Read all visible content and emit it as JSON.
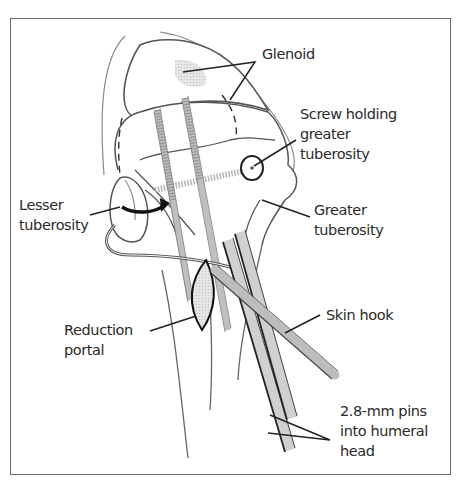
{
  "figure": {
    "type": "surgical-illustration"
  },
  "labels": {
    "glenoid": "Glenoid",
    "screw": "Screw holding\ngreater\ntuberosity",
    "greater_tuberosity": "Greater\ntuberosity",
    "lesser_tuberosity": "Lesser\ntuberosity",
    "reduction_portal": "Reduction\nportal",
    "skin_hook": "Skin hook",
    "pins": "2.8-mm pins\ninto humeral\nhead"
  },
  "colors": {
    "line": "#3a3a3a",
    "fill_gray": "#cfcfcf",
    "fill_light": "#e4e4e4",
    "frame": "#6a6a6a"
  }
}
